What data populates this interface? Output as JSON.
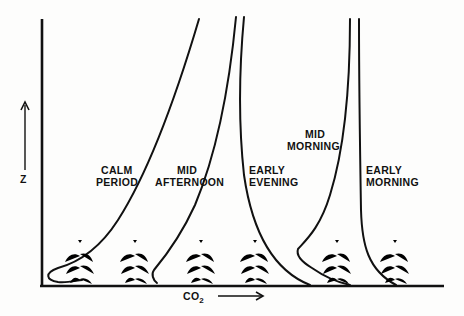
{
  "diagram": {
    "axes": {
      "y_label": "Z",
      "x_label_main": "CO",
      "x_label_sub": "2"
    },
    "profiles": [
      {
        "id": "calm-period",
        "line1": "CALM",
        "line2": "PERIOD"
      },
      {
        "id": "mid-afternoon",
        "line1": "MID",
        "line2": "AFTERNOON"
      },
      {
        "id": "early-evening",
        "line1": "EARLY",
        "line2": "EVENING"
      },
      {
        "id": "mid-morning",
        "line1": "MID",
        "line2": "MORNING"
      },
      {
        "id": "early-morning",
        "line1": "EARLY",
        "line2": "MORNING"
      }
    ],
    "plants_count": 6,
    "colors": {
      "ink": "#111111",
      "paper": "#fdfdfc"
    }
  }
}
